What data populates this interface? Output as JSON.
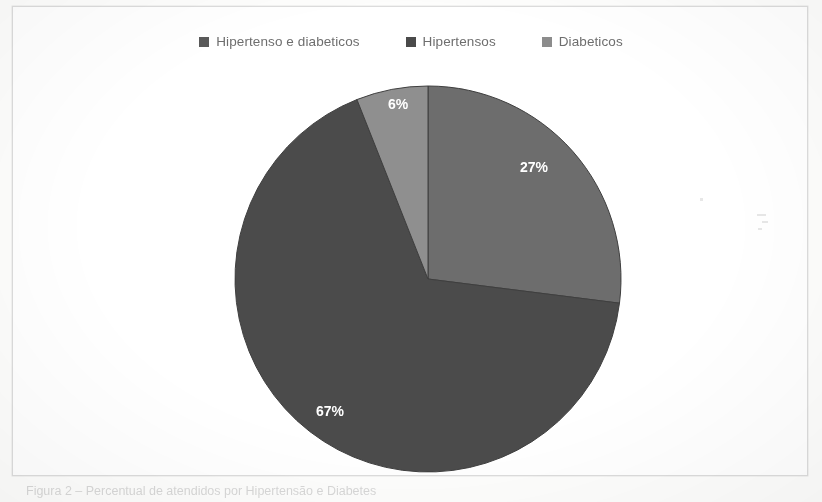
{
  "page": {
    "background_color": "#fdfdfc",
    "frame_border_color": "#dcdcdc",
    "caption": "Figura 2 – Percentual de atendidos por Hipertensão e Diabetes"
  },
  "legend": {
    "position": "top-center",
    "items": [
      {
        "label": "Hipertenso e diabeticos",
        "color": "#595959",
        "swatch_icon": "square-marker"
      },
      {
        "label": "Hipertensos",
        "color": "#4a4a4a",
        "swatch_icon": "square-marker"
      },
      {
        "label": "Diabeticos",
        "color": "#8c8c8c",
        "swatch_icon": "square-marker"
      }
    ]
  },
  "chart_data": {
    "type": "pie",
    "title": "",
    "subtitle": "",
    "xlabel": "",
    "ylabel": "",
    "legend_position": "top",
    "grid": false,
    "start_angle_deg": 0,
    "direction": "clockwise",
    "categories": [
      "Hipertenso e diabeticos",
      "Hipertensos",
      "Diabeticos"
    ],
    "values": [
      67,
      27,
      6
    ],
    "value_unit": "%",
    "data_labels": [
      "67%",
      "27%",
      "6%"
    ],
    "slices": [
      {
        "name": "Hipertensos",
        "label": "27%",
        "value": 27,
        "color": "#6d6d6d",
        "start_deg": 0,
        "end_deg": 97.2,
        "label_x": 521,
        "label_y": 165
      },
      {
        "name": "Hipertenso e diabeticos",
        "label": "67%",
        "value": 67,
        "color": "#4b4b4b",
        "start_deg": 97.2,
        "end_deg": 338.4,
        "label_x": 317,
        "label_y": 409
      },
      {
        "name": "Diabeticos",
        "label": "6%",
        "value": 6,
        "color": "#8f8f8f",
        "start_deg": 338.4,
        "end_deg": 360,
        "label_x": 385,
        "label_y": 102
      }
    ],
    "geometry": {
      "center_x": 415,
      "center_y": 272,
      "radius": 193
    }
  }
}
